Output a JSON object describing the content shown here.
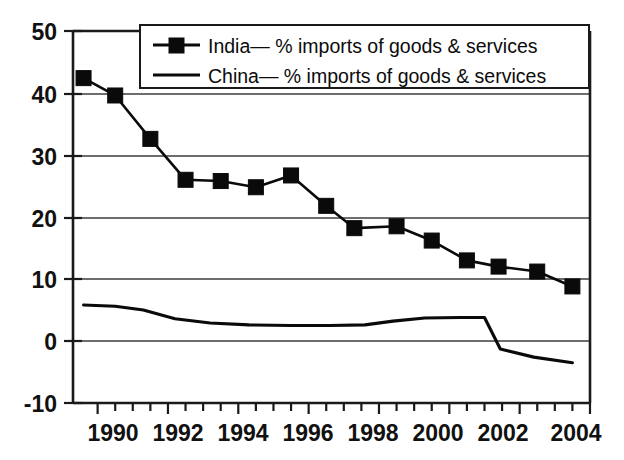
{
  "chart_data": {
    "type": "line",
    "title": "",
    "subtitle": "",
    "xlabel": "",
    "ylabel": "",
    "xlim": [
      1989.3,
      2004.0
    ],
    "ylim": [
      -10,
      50
    ],
    "grid": "horizontal",
    "legend_position": "top-center",
    "y_ticks": [
      "50",
      "40",
      "30",
      "20",
      "10",
      "0",
      "-10"
    ],
    "y_tick_values": [
      50,
      40,
      30,
      20,
      10,
      0,
      -10
    ],
    "x_ticks": [
      "1990",
      "1992",
      "1994",
      "1996",
      "1998",
      "2000",
      "2002",
      "2004"
    ],
    "x_tick_values": [
      1990,
      1992,
      1994,
      1996,
      1998,
      2000,
      2002,
      2004
    ],
    "x_minor_interval": 0.5,
    "series": [
      {
        "name": "India— % imports of goods & services",
        "short_name": "India",
        "marker": "filled-square",
        "color": "#0a0a0a",
        "x": [
          1989.6,
          1990.5,
          1991.5,
          1992.5,
          1993.5,
          1994.5,
          1995.5,
          1996.5,
          1997.3,
          1998.5,
          1999.5,
          2000.5,
          2001.4,
          2002.5,
          2003.5
        ],
        "values": [
          42.4,
          39.6,
          32.6,
          26.0,
          25.8,
          24.8,
          26.7,
          21.8,
          18.2,
          18.5,
          16.2,
          13.0,
          12.0,
          11.2,
          8.8
        ]
      },
      {
        "name": "China— % imports of goods & services",
        "short_name": "China",
        "marker": "none",
        "color": "#0a0a0a",
        "x": [
          1989.6,
          1990.5,
          1991.3,
          1992.2,
          1993.2,
          1994.3,
          1995.5,
          1996.6,
          1997.6,
          1998.4,
          1999.3,
          2000.3,
          2001.0,
          2001.45,
          2002.4,
          2003.5
        ],
        "values": [
          5.8,
          5.6,
          5.0,
          3.6,
          2.9,
          2.6,
          2.5,
          2.5,
          2.6,
          3.2,
          3.7,
          3.8,
          3.8,
          -1.3,
          -2.6,
          -3.5
        ]
      }
    ]
  },
  "legend": {
    "entries": [
      {
        "label": "India— % imports of goods & services",
        "marker": "filled-square"
      },
      {
        "label": "China— % imports of goods & services",
        "marker": "line"
      }
    ]
  }
}
